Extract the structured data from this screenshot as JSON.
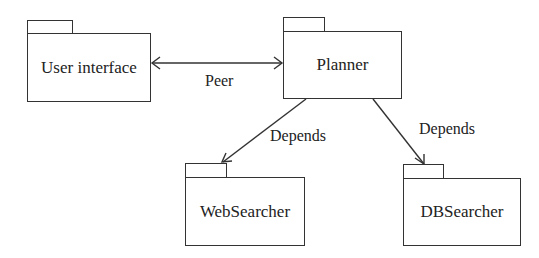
{
  "diagram": {
    "type": "UML package diagram",
    "packages": [
      {
        "id": "ui",
        "label": "User interface"
      },
      {
        "id": "planner",
        "label": "Planner"
      },
      {
        "id": "web",
        "label": "WebSearcher"
      },
      {
        "id": "db",
        "label": "DBSearcher"
      }
    ],
    "edges": [
      {
        "from": "ui",
        "to": "planner",
        "label": "Peer",
        "style": "bidirectional-arrow"
      },
      {
        "from": "planner",
        "to": "web",
        "label": "Depends",
        "style": "arrow"
      },
      {
        "from": "planner",
        "to": "db",
        "label": "Depends",
        "style": "arrow"
      }
    ],
    "line_color": "#333333"
  }
}
